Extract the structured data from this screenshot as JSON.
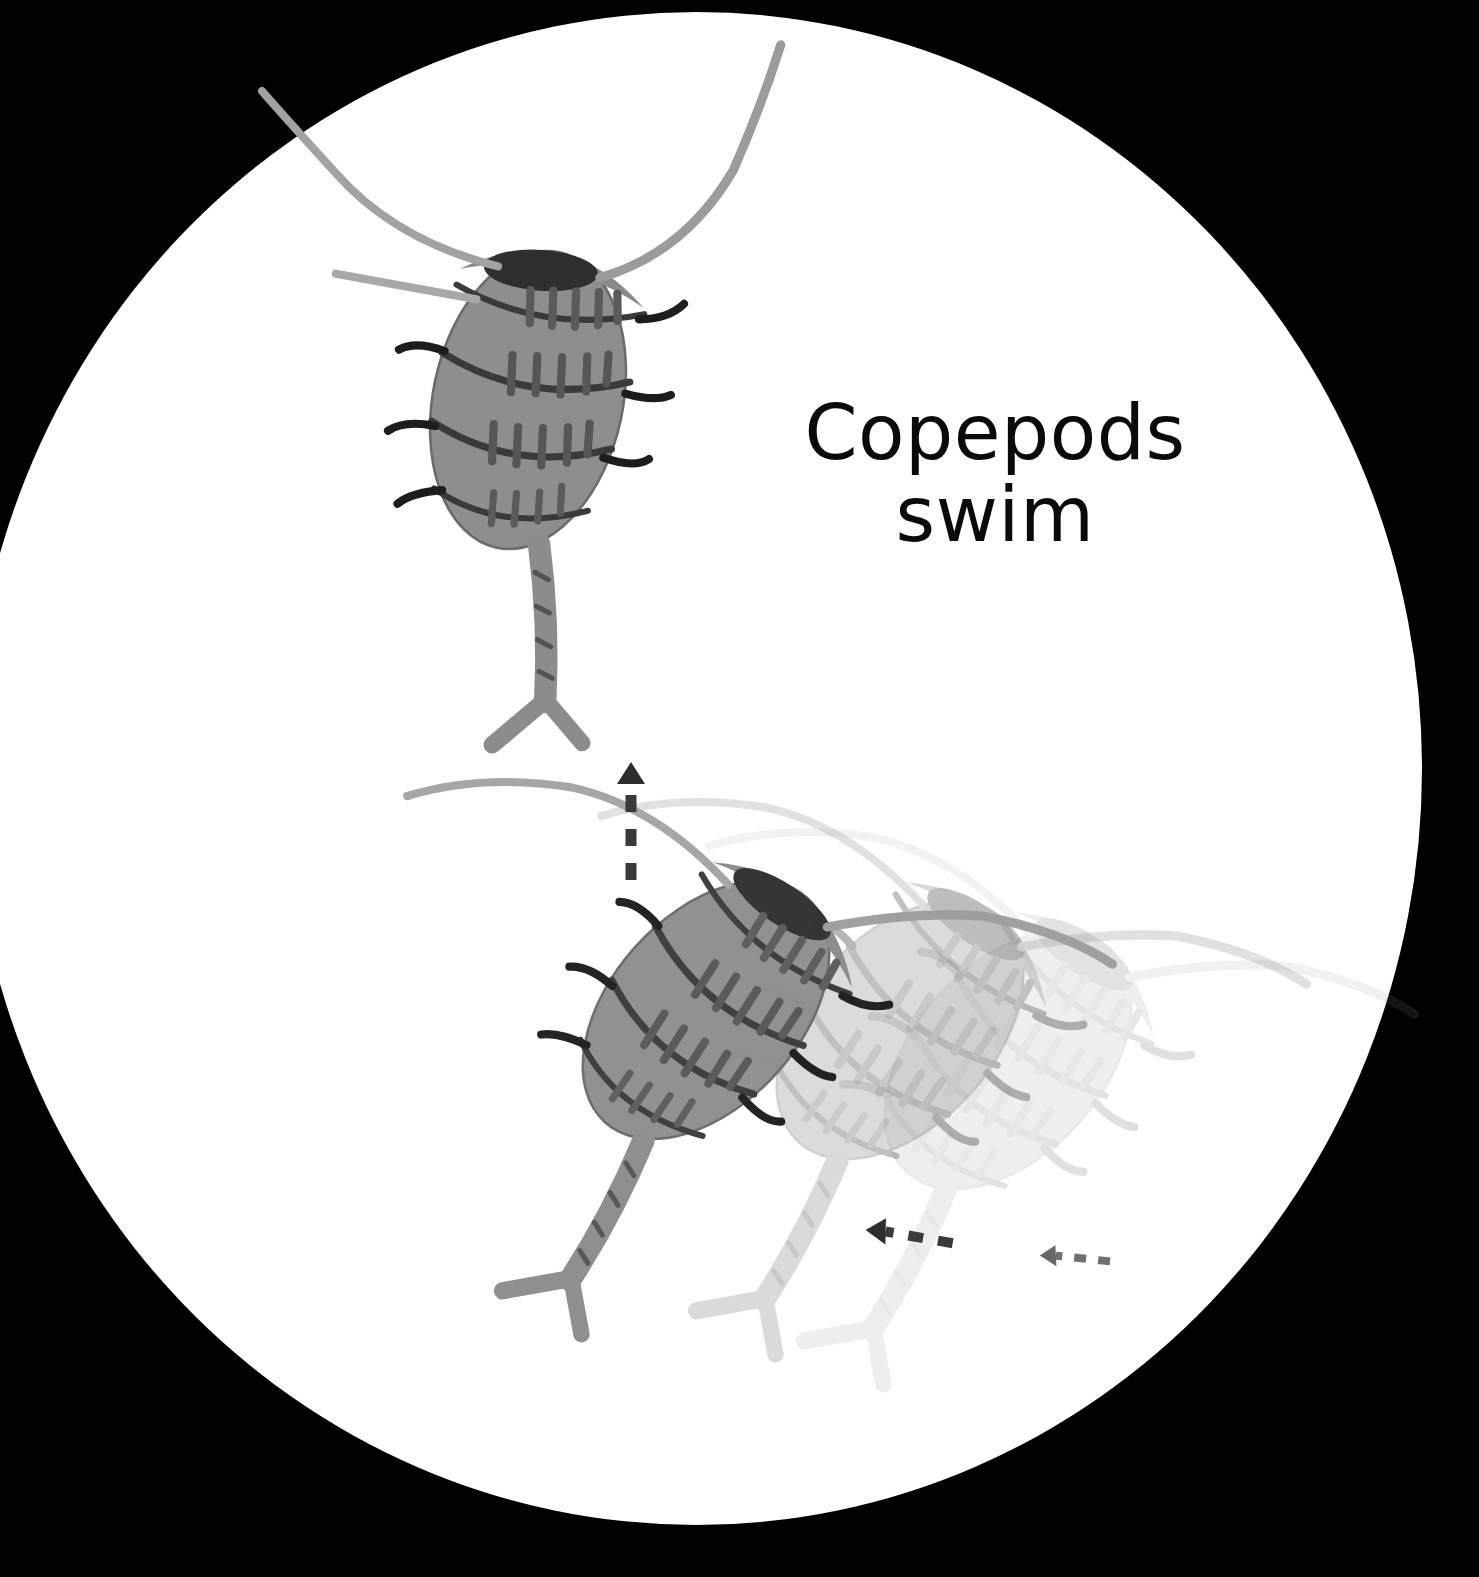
{
  "view": {
    "kind": "microscope-field",
    "background_color": "#010101",
    "field_color": "#fefefe",
    "field_shape": "circle"
  },
  "label": {
    "line1": "Copepods",
    "line2": "swim",
    "color": "#0a0a0a",
    "font_size_px": 76
  },
  "specimens": [
    {
      "name": "copepod-upper",
      "opacity": 1.0,
      "body_color": "#8e8e8e",
      "stripe_color": "#5a5a5a",
      "outline_color": "#3b3b3b",
      "eye_color": "#2e2e2e",
      "rotation_deg": 12,
      "segments": 4,
      "antennae": 3,
      "legs": 6,
      "has_furca": true
    },
    {
      "name": "copepod-lower",
      "opacity": 1.0,
      "body_color": "#8e8e8e",
      "stripe_color": "#565656",
      "outline_color": "#3b3b3b",
      "eye_color": "#2b2b2b",
      "rotation_deg": 42,
      "segments": 4,
      "antennae": 2,
      "legs": 4,
      "has_furca": true
    },
    {
      "name": "copepod-ghost-near",
      "opacity": 0.34,
      "body_color": "#9a9a9a",
      "rotation_deg": 42,
      "note": "motion trail"
    },
    {
      "name": "copepod-ghost-far",
      "opacity": 0.14,
      "body_color": "#a5a5a5",
      "rotation_deg": 42,
      "note": "motion trail"
    }
  ],
  "motion_arrows": [
    {
      "name": "arrow-up-vertical",
      "direction": "up",
      "style": "dashed",
      "color": "#3a3a3a",
      "opacity": 1.0
    },
    {
      "name": "arrow-left-primary",
      "direction": "left",
      "style": "dashed",
      "color": "#3a3a3a",
      "opacity": 1.0
    },
    {
      "name": "arrow-left-secondary",
      "direction": "left",
      "style": "dashed",
      "color": "#4a4a4a",
      "opacity": 0.75
    }
  ]
}
